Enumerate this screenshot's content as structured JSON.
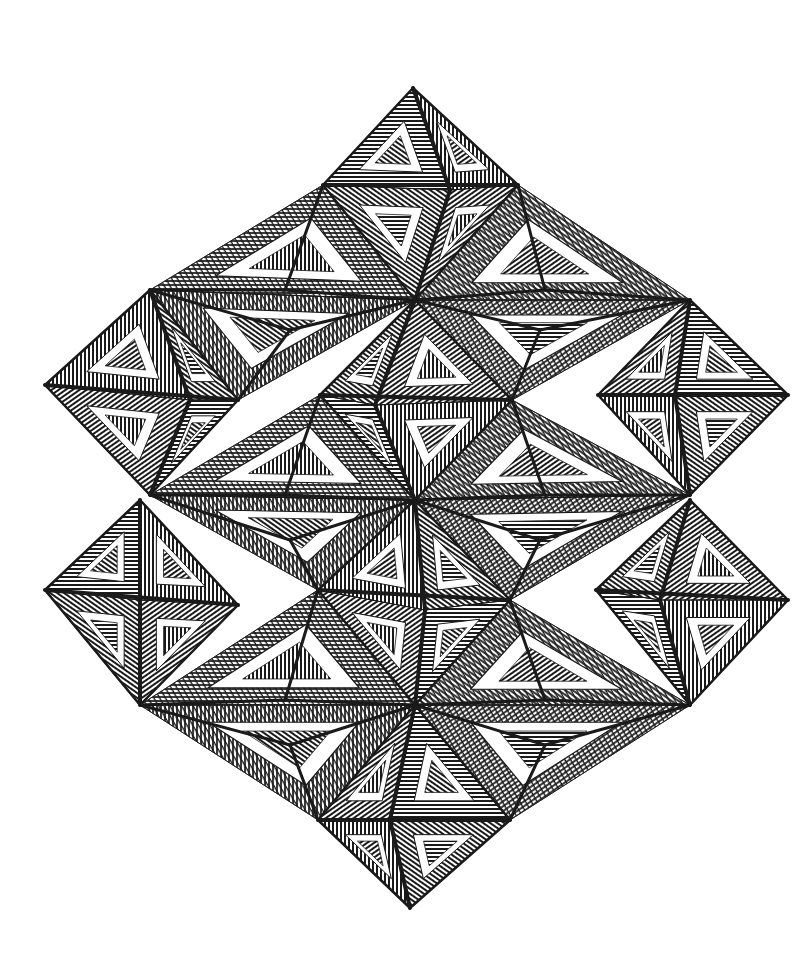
{
  "artwork": {
    "description": "Op-art line drawing: lattice of hatched octahedra and tetrahedra forming a large rhombic tessellation",
    "background_color": "#ffffff",
    "ink_color": "#1a1a1a",
    "octahedra": [
      {
        "id": "top",
        "top": [
          413,
          88
        ],
        "left": [
          323,
          185
        ],
        "right": [
          518,
          185
        ],
        "bottom": [
          415,
          300
        ],
        "front": [
          450,
          190
        ]
      },
      {
        "id": "left-upper",
        "top": [
          150,
          290
        ],
        "left": [
          45,
          385
        ],
        "right": [
          238,
          400
        ],
        "bottom": [
          150,
          495
        ],
        "front": [
          190,
          400
        ]
      },
      {
        "id": "center-upper",
        "top": [
          415,
          300
        ],
        "left": [
          320,
          395
        ],
        "right": [
          512,
          400
        ],
        "bottom": [
          415,
          500
        ],
        "front": [
          375,
          405
        ]
      },
      {
        "id": "right-upper",
        "top": [
          690,
          300
        ],
        "left": [
          598,
          395
        ],
        "right": [
          788,
          395
        ],
        "bottom": [
          690,
          495
        ],
        "front": [
          675,
          395
        ]
      },
      {
        "id": "left-lower",
        "top": [
          140,
          500
        ],
        "left": [
          45,
          590
        ],
        "right": [
          238,
          605
        ],
        "bottom": [
          140,
          705
        ],
        "front": [
          140,
          600
        ]
      },
      {
        "id": "center-lower",
        "top": [
          415,
          500
        ],
        "left": [
          318,
          590
        ],
        "right": [
          510,
          600
        ],
        "bottom": [
          415,
          705
        ],
        "front": [
          425,
          610
        ]
      },
      {
        "id": "right-lower",
        "top": [
          690,
          500
        ],
        "left": [
          596,
          590
        ],
        "right": [
          788,
          600
        ],
        "bottom": [
          690,
          705
        ],
        "front": [
          660,
          600
        ]
      },
      {
        "id": "bottom",
        "top": [
          415,
          705
        ],
        "left": [
          318,
          820
        ],
        "right": [
          510,
          820
        ],
        "bottom": [
          410,
          908
        ],
        "front": [
          390,
          820
        ]
      }
    ],
    "tetrahedra": [
      {
        "id": "t-upper-left-a",
        "a": [
          150,
          290
        ],
        "b": [
          323,
          185
        ],
        "c": [
          415,
          300
        ],
        "apex": [
          285,
          290
        ]
      },
      {
        "id": "t-upper-left-b",
        "a": [
          150,
          290
        ],
        "b": [
          238,
          400
        ],
        "c": [
          415,
          300
        ],
        "apex": [
          290,
          330
        ]
      },
      {
        "id": "t-upper-right-a",
        "a": [
          518,
          185
        ],
        "b": [
          690,
          300
        ],
        "c": [
          415,
          300
        ],
        "apex": [
          545,
          290
        ]
      },
      {
        "id": "t-upper-right-b",
        "a": [
          690,
          300
        ],
        "b": [
          512,
          400
        ],
        "c": [
          415,
          300
        ],
        "apex": [
          540,
          330
        ]
      },
      {
        "id": "t-mid-left-a",
        "a": [
          150,
          495
        ],
        "b": [
          320,
          395
        ],
        "c": [
          415,
          500
        ],
        "apex": [
          285,
          495
        ]
      },
      {
        "id": "t-mid-left-b",
        "a": [
          150,
          495
        ],
        "b": [
          318,
          590
        ],
        "c": [
          415,
          500
        ],
        "apex": [
          290,
          540
        ]
      },
      {
        "id": "t-mid-right-a",
        "a": [
          512,
          400
        ],
        "b": [
          690,
          495
        ],
        "c": [
          415,
          500
        ],
        "apex": [
          545,
          495
        ]
      },
      {
        "id": "t-mid-right-b",
        "a": [
          690,
          495
        ],
        "b": [
          510,
          600
        ],
        "c": [
          415,
          500
        ],
        "apex": [
          540,
          540
        ]
      },
      {
        "id": "t-low-left-a",
        "a": [
          140,
          705
        ],
        "b": [
          318,
          590
        ],
        "c": [
          415,
          705
        ],
        "apex": [
          285,
          700
        ]
      },
      {
        "id": "t-low-left-b",
        "a": [
          140,
          705
        ],
        "b": [
          318,
          820
        ],
        "c": [
          415,
          705
        ],
        "apex": [
          290,
          745
        ]
      },
      {
        "id": "t-low-right-a",
        "a": [
          510,
          600
        ],
        "b": [
          690,
          705
        ],
        "c": [
          415,
          705
        ],
        "apex": [
          545,
          700
        ]
      },
      {
        "id": "t-low-right-b",
        "a": [
          690,
          705
        ],
        "b": [
          510,
          820
        ],
        "c": [
          415,
          705
        ],
        "apex": [
          545,
          745
        ]
      }
    ]
  }
}
